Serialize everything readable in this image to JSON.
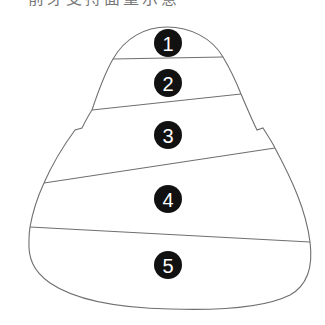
{
  "title": "前牙支持面量示意",
  "diagram": {
    "shape": "tooth-crown-outline",
    "regions": [
      {
        "label": "1",
        "cx": 168,
        "cy": 43
      },
      {
        "label": "2",
        "cx": 168,
        "cy": 83
      },
      {
        "label": "3",
        "cx": 168,
        "cy": 135
      },
      {
        "label": "4",
        "cx": 168,
        "cy": 199
      },
      {
        "label": "5",
        "cx": 168,
        "cy": 265
      }
    ],
    "colors": {
      "outline": "#6f6f6f",
      "badge": "#111111",
      "badge_text": "#ffffff"
    }
  }
}
